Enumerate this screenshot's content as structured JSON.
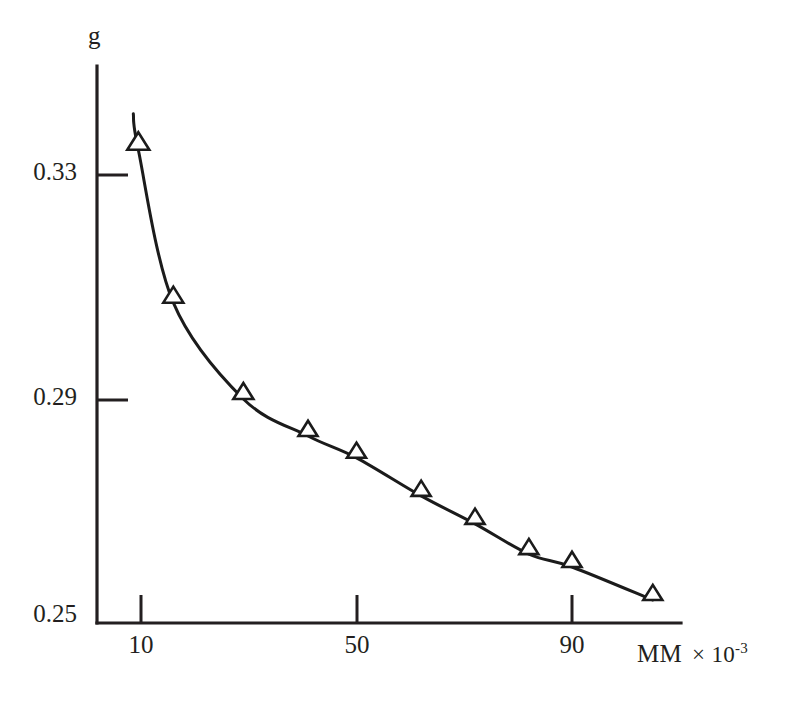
{
  "chart_data": {
    "type": "line",
    "title": "",
    "xlabel": "MM  × 10",
    "xlabel_exponent": "-3",
    "ylabel": "g",
    "x": [
      9.5,
      16,
      29,
      41,
      50,
      62,
      72,
      82,
      90,
      105
    ],
    "values": [
      0.3345,
      0.3072,
      0.29,
      0.2834,
      0.2795,
      0.2727,
      0.2677,
      0.2623,
      0.26,
      0.2541
    ],
    "series": [
      {
        "name": "g vs MM",
        "marker": "open-triangle",
        "values": [
          0.3345,
          0.3072,
          0.29,
          0.2834,
          0.2795,
          0.2727,
          0.2677,
          0.2623,
          0.26,
          0.2541
        ]
      }
    ],
    "xlim": [
      5,
      113
    ],
    "ylim": [
      0.25,
      0.3485
    ],
    "xticks": [
      10,
      50,
      90
    ],
    "xticklabels": [
      "10",
      "50",
      "90"
    ],
    "yticks": [
      0.25,
      0.29,
      0.33
    ],
    "yticklabels": [
      "0.25",
      "0.29",
      "0.33"
    ],
    "grid": false,
    "legend": "none",
    "line_color": "#1b1b1b",
    "axis_color": "#231f20",
    "background": "#ffffff"
  },
  "axes": {
    "y_title": "g",
    "x_title_unit": "MM",
    "x_title_times": "× 10",
    "x_title_exp": "-3"
  },
  "ticks": {
    "y": [
      {
        "label": "0.33",
        "value": 0.33
      },
      {
        "label": "0.29",
        "value": 0.29
      },
      {
        "label": "0.25",
        "value": 0.25
      }
    ],
    "x": [
      {
        "label": "10",
        "value": 10
      },
      {
        "label": "50",
        "value": 50
      },
      {
        "label": "90",
        "value": 90
      }
    ]
  }
}
